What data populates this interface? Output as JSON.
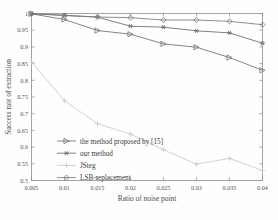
{
  "chart_data": {
    "type": "line",
    "title": "",
    "xlabel": "Ratio of noise point",
    "ylabel": "Success rate of extraction",
    "x": [
      0.005,
      0.01,
      0.015,
      0.02,
      0.025,
      0.03,
      0.035,
      0.04
    ],
    "xtick_labels": [
      "0.005",
      "0.01",
      "0.015",
      "0.02",
      "0.025",
      "0.03",
      "0.035",
      "0.04"
    ],
    "ytick_labels": [
      "0.5",
      "0.55",
      "0.6",
      "0.65",
      "0.7",
      "0.75",
      "0.8",
      "0.85",
      "0.9",
      "0.95",
      "1"
    ],
    "ytick_values": [
      0.5,
      0.55,
      0.6,
      0.65,
      0.7,
      0.75,
      0.8,
      0.85,
      0.9,
      0.95,
      1.0
    ],
    "xlim": [
      0.005,
      0.04
    ],
    "ylim": [
      0.5,
      1.0
    ],
    "grid": false,
    "legend_position": "lower-left-inside",
    "series": [
      {
        "name": "the method proposed by [15]",
        "marker": "triangle-right",
        "color": "#6f6f6f",
        "values": [
          0.999,
          0.982,
          0.949,
          0.938,
          0.909,
          0.899,
          0.868,
          0.83
        ]
      },
      {
        "name": "our method",
        "marker": "asterisk",
        "color": "#6a6a6a",
        "values": [
          0.999,
          0.995,
          0.989,
          0.962,
          0.959,
          0.948,
          0.942,
          0.911
        ]
      },
      {
        "name": "JSteg",
        "marker": "plus",
        "color": "#c9c9c9",
        "values": [
          0.855,
          0.739,
          0.67,
          0.639,
          0.592,
          0.549,
          0.566,
          0.53
        ]
      },
      {
        "name": "LSB-replacement",
        "marker": "diamond",
        "color": "#7a7a7a",
        "values": [
          1.0,
          0.9935,
          0.9895,
          0.9875,
          0.9805,
          0.9805,
          0.9765,
          0.9665
        ]
      }
    ]
  },
  "axes": {
    "xlabel": "Ratio of noise point",
    "ylabel": "Success rate of extraction"
  }
}
